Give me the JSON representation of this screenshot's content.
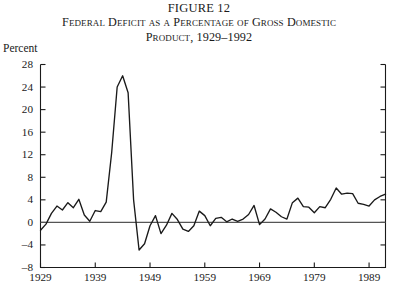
{
  "figure": {
    "number_label": "FIGURE 12",
    "title_line1": "Federal Deficit as a Percentage of Gross Domestic",
    "title_line2": "Product, 1929–1992"
  },
  "axes": {
    "unit_label": "Percent",
    "y_ticks": [
      "28",
      "24",
      "20",
      "16",
      "12",
      "8",
      "4",
      "0",
      "–4",
      "–8"
    ],
    "x_ticks": [
      "1929",
      "1939",
      "1949",
      "1959",
      "1969",
      "1979",
      "1989"
    ]
  },
  "colors": {
    "line": "#1a1a1a",
    "axis": "#1a1a1a",
    "zero_line": "#555555",
    "background": "#ffffff"
  },
  "chart_data": {
    "type": "line",
    "xlabel": "",
    "ylabel": "Percent",
    "xlim": [
      1929,
      1992
    ],
    "ylim": [
      -8,
      28
    ],
    "y_tick_values": [
      28,
      24,
      20,
      16,
      12,
      8,
      4,
      0,
      -4,
      -8
    ],
    "x_tick_values": [
      1929,
      1939,
      1949,
      1959,
      1969,
      1979,
      1989
    ],
    "grid": false,
    "legend": "none",
    "zero_reference_line": 0,
    "series": [
      {
        "name": "Federal deficit (% of GDP)",
        "x": [
          1929,
          1930,
          1931,
          1932,
          1933,
          1934,
          1935,
          1936,
          1937,
          1938,
          1939,
          1940,
          1941,
          1942,
          1943,
          1944,
          1945,
          1946,
          1947,
          1948,
          1949,
          1950,
          1951,
          1952,
          1953,
          1954,
          1955,
          1956,
          1957,
          1958,
          1959,
          1960,
          1961,
          1962,
          1963,
          1964,
          1965,
          1966,
          1967,
          1968,
          1969,
          1970,
          1971,
          1972,
          1973,
          1974,
          1975,
          1976,
          1977,
          1978,
          1979,
          1980,
          1981,
          1982,
          1983,
          1984,
          1985,
          1986,
          1987,
          1988,
          1989,
          1990,
          1991,
          1992
        ],
        "values": [
          -1.4,
          -0.3,
          1.6,
          2.9,
          2.2,
          3.5,
          2.6,
          4.1,
          1.3,
          0.2,
          2.1,
          1.9,
          3.6,
          12.4,
          24.0,
          26.0,
          23.0,
          4.0,
          -4.9,
          -3.8,
          -0.6,
          1.2,
          -2.0,
          -0.5,
          1.6,
          0.5,
          -1.2,
          -1.6,
          -0.6,
          2.0,
          1.2,
          -0.6,
          0.7,
          0.9,
          0.1,
          0.6,
          0.2,
          0.6,
          1.4,
          3.0,
          -0.4,
          0.6,
          2.4,
          1.8,
          1.0,
          0.6,
          3.5,
          4.3,
          2.8,
          2.7,
          1.7,
          2.8,
          2.6,
          4.1,
          6.1,
          5.0,
          5.2,
          5.1,
          3.4,
          3.2,
          2.9,
          4.0,
          4.6,
          5.0
        ]
      }
    ]
  }
}
